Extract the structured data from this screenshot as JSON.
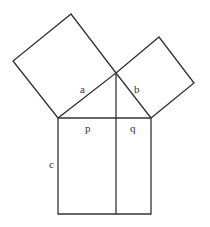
{
  "diagram": {
    "title": "",
    "labels": {
      "a": "a",
      "b": "b",
      "c": "c",
      "p": "p",
      "q": "q"
    },
    "colors": {
      "stroke": "#333333",
      "background": "#ffffff",
      "text": "#333333"
    }
  }
}
